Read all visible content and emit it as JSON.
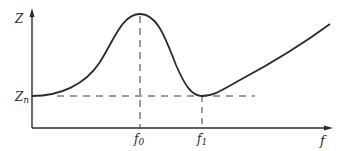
{
  "diagram": {
    "type": "impedance-frequency curve",
    "y_axis": {
      "label": "Z",
      "reference_label": "Z_n"
    },
    "x_axis": {
      "label": "f",
      "ticks": [
        "f_0",
        "f_1"
      ]
    },
    "labels": {
      "z": "Z",
      "zn_main": "Z",
      "zn_sub": "n",
      "f0_main": "f",
      "f0_sub": "0",
      "f1_main": "f",
      "f1_sub": "1",
      "f": "f"
    },
    "curve": {
      "description": "Starts at Z_n, rises to a maximum at f_0, falls to a minimum equal to Z_n at f_1, then rises roughly linearly",
      "points": [
        {
          "name": "start",
          "x": 32,
          "y": 96
        },
        {
          "name": "peak_f0",
          "x": 140,
          "y": 14
        },
        {
          "name": "min_f1",
          "x": 202,
          "y": 96
        },
        {
          "name": "end",
          "x": 330,
          "y": 24
        }
      ]
    },
    "colors": {
      "line": "#2b2b2b",
      "background": "#ffffff"
    }
  }
}
